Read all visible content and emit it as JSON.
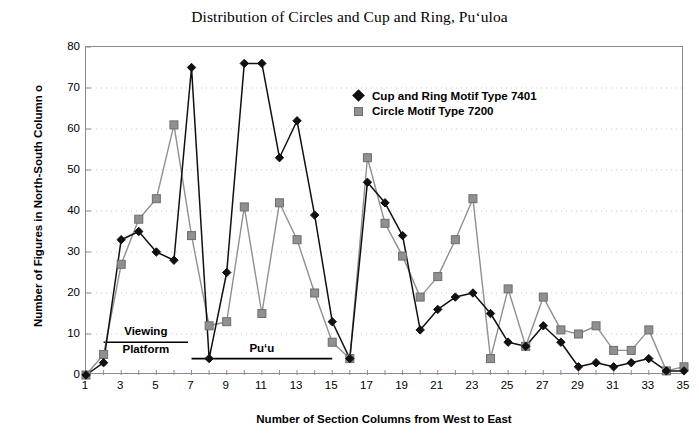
{
  "chart_data": {
    "type": "line",
    "title": "Distribution of Circles and Cup and Ring, Pu‘uloa",
    "xlabel": "Number of Section Columns from West to East",
    "ylabel": "Number of Figures in North-South Column o",
    "xlim": [
      1,
      35
    ],
    "ylim": [
      0,
      80
    ],
    "yticks": [
      0,
      10,
      20,
      30,
      40,
      50,
      60,
      70,
      80
    ],
    "xticks": [
      1,
      3,
      5,
      7,
      9,
      11,
      13,
      15,
      17,
      19,
      21,
      23,
      25,
      27,
      29,
      31,
      33,
      35
    ],
    "grid": true,
    "legend_position": "upper-center-right",
    "x": [
      1,
      2,
      3,
      4,
      5,
      6,
      7,
      8,
      9,
      10,
      11,
      12,
      13,
      14,
      15,
      16,
      17,
      18,
      19,
      20,
      21,
      22,
      23,
      24,
      25,
      26,
      27,
      28,
      29,
      30,
      31,
      32,
      33,
      34,
      35
    ],
    "series": [
      {
        "name": "Cup and Ring Motif Type 7401",
        "marker": "diamond",
        "color": "#111111",
        "values": [
          0,
          3,
          33,
          35,
          30,
          28,
          75,
          4,
          25,
          76,
          76,
          53,
          62,
          39,
          13,
          4,
          47,
          42,
          34,
          11,
          16,
          19,
          20,
          15,
          8,
          7,
          12,
          8,
          2,
          3,
          2,
          3,
          4,
          1,
          1
        ]
      },
      {
        "name": "Circle Motif Type 7200",
        "marker": "square",
        "color": "#909090",
        "values": [
          0,
          5,
          27,
          38,
          43,
          61,
          34,
          12,
          13,
          41,
          15,
          42,
          33,
          20,
          8,
          4,
          53,
          37,
          29,
          19,
          24,
          33,
          43,
          4,
          21,
          7,
          19,
          11,
          10,
          12,
          6,
          6,
          11,
          1,
          2
        ]
      }
    ],
    "annotations": [
      {
        "label_line1": "Viewing",
        "label_line2": "Platform",
        "x_start": 2,
        "x_end": 6.8,
        "y": 8
      },
      {
        "label_line1": "Pu‘u",
        "label_line2": "",
        "x_start": 7,
        "x_end": 15,
        "y": 4
      }
    ]
  },
  "legend": {
    "items": [
      {
        "label": "Cup and Ring Motif Type 7401",
        "marker": "diamond"
      },
      {
        "label": "Circle Motif Type 7200",
        "marker": "square"
      }
    ]
  },
  "colors": {
    "series_cup_and_ring": "#111111",
    "series_circle": "#909090",
    "axis": "#8c8c8c",
    "grid": "#c9c9c9",
    "text": "#000000",
    "background": "#ffffff"
  }
}
